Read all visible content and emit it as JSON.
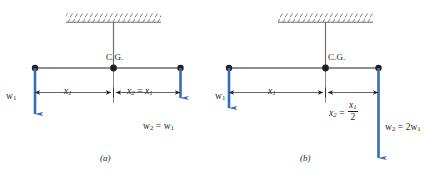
{
  "figure": {
    "colors": {
      "line": "#231f20",
      "force_arrow": "#2f6fc0",
      "hatch": "#6d6e71",
      "text": "#231f20",
      "background": "#ffffff"
    },
    "panels": [
      {
        "id": "a",
        "caption": "(a)",
        "cg_label": "C.G.",
        "left_force_label": {
          "symbol": "w",
          "subscript": "1"
        },
        "right_force_label": {
          "lhs_symbol": "w",
          "lhs_subscript": "2",
          "relation": "=",
          "rhs_symbol": "w",
          "rhs_subscript": "1"
        },
        "left_dimension_label": {
          "symbol": "x",
          "subscript": "1"
        },
        "right_dimension_label": {
          "lhs_symbol": "x",
          "lhs_subscript": "2",
          "relation": "=",
          "rhs_symbol": "x",
          "rhs_subscript": "1"
        },
        "note": "equal weights at equal distances"
      },
      {
        "id": "b",
        "caption": "(b)",
        "cg_label": "C.G.",
        "left_force_label": {
          "symbol": "w",
          "subscript": "1"
        },
        "right_force_label": {
          "lhs_symbol": "w",
          "lhs_subscript": "2",
          "relation": "=",
          "rhs_coefficient": "2",
          "rhs_symbol": "w",
          "rhs_subscript": "1"
        },
        "left_dimension_label": {
          "symbol": "x",
          "subscript": "1"
        },
        "right_dimension_label": {
          "lhs_symbol": "x",
          "lhs_subscript": "2",
          "relation": "=",
          "fraction_numerator_symbol": "x",
          "fraction_numerator_subscript": "1",
          "fraction_denominator": "2"
        },
        "note": "double weight at half distance"
      }
    ]
  }
}
